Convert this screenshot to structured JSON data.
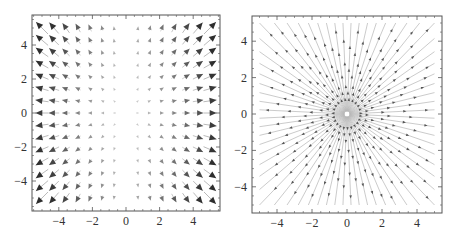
{
  "chart_data": [
    {
      "type": "vector_field",
      "title": "",
      "xlabel": "",
      "ylabel": "",
      "xlim": [
        -5.6,
        5.6
      ],
      "ylim": [
        -5.75,
        5.75
      ],
      "xticks": [
        -4,
        -2,
        0,
        2,
        4
      ],
      "yticks": [
        -4,
        -2,
        0,
        2,
        4
      ],
      "xtick_labels": [
        "−4",
        "−2",
        "0",
        "2",
        "4"
      ],
      "ytick_labels": [
        "−4",
        "−2",
        "0",
        "2",
        "4"
      ],
      "grid": false,
      "legend": null,
      "sample_grid": {
        "min": -5,
        "max": 5,
        "points_per_axis": 15
      },
      "field_description": "direction (x, y), magnitude proportional to |x|*sqrt(x^2+y^2); arrows shaded darker with larger magnitude; near-zero along x = 0",
      "colors": {
        "head_dark": "#2e2e2e",
        "head_light": "#e6e6e6",
        "shaft": "#a8a8a8"
      }
    },
    {
      "type": "stream",
      "title": "",
      "xlabel": "",
      "ylabel": "",
      "xlim": [
        -5.4,
        5.4
      ],
      "ylim": [
        -5.4,
        5.4
      ],
      "xticks": [
        -4,
        -2,
        0,
        2,
        4
      ],
      "yticks": [
        -4,
        -2,
        0,
        2,
        4
      ],
      "xtick_labels": [
        "−4",
        "−2",
        "0",
        "2",
        "4"
      ],
      "ytick_labels": [
        "−4",
        "−2",
        "0",
        "2",
        "4"
      ],
      "grid": false,
      "legend": null,
      "field_description": "radial streamlines emanating outward from the origin (0,0), extending to the square |x|<=5, |y|<=5, with arrowheads pointing outward",
      "streamline_count": 68,
      "arrow_spacing_units": 1.25,
      "colors": {
        "line": "#b4b4b4",
        "arrow": "#555555"
      }
    }
  ],
  "panels": [
    {
      "name": "left-vector-plot",
      "frame": {
        "x0": 32,
        "y0": 15,
        "x1": 220,
        "y1": 211
      },
      "origin_px": [
        126,
        113
      ],
      "scale_px": [
        16.8,
        17.0
      ]
    },
    {
      "name": "right-stream-plot",
      "frame": {
        "x0": 252,
        "y0": 16,
        "x1": 442,
        "y1": 213
      },
      "origin_px": [
        347,
        114
      ],
      "scale_px": [
        17.5,
        18.2
      ]
    }
  ]
}
